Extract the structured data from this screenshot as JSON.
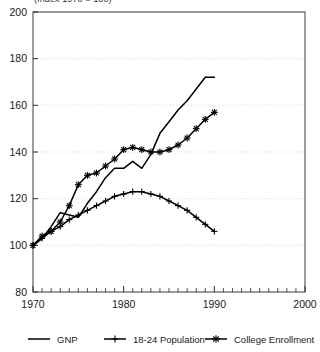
{
  "chart_data": {
    "type": "line",
    "title": "(Index 1970 = 100)",
    "xlabel": "",
    "ylabel": "",
    "xlim": [
      1970,
      2000
    ],
    "ylim": [
      80,
      200
    ],
    "xticks": [
      1970,
      1980,
      1990,
      2000
    ],
    "yticks": [
      80,
      100,
      120,
      140,
      160,
      180,
      200
    ],
    "grid": true,
    "grid_axis": "y",
    "legend_position": "bottom",
    "minor_xticks_interval": 1,
    "x": [
      1970,
      1971,
      1972,
      1973,
      1974,
      1975,
      1976,
      1977,
      1978,
      1979,
      1980,
      1981,
      1982,
      1983,
      1984,
      1985,
      1986,
      1987,
      1988,
      1989,
      1990
    ],
    "series": [
      {
        "name": "GNP",
        "marker": "none",
        "color": "#000000",
        "values": [
          100,
          103,
          108,
          114,
          113,
          112,
          118,
          123,
          129,
          133,
          133,
          136,
          133,
          139,
          148,
          153,
          158,
          162,
          167,
          172,
          172
        ]
      },
      {
        "name": "18-24 Population",
        "marker": "plus",
        "color": "#000000",
        "values": [
          100,
          103,
          106,
          108,
          111,
          113,
          115,
          117,
          119,
          121,
          122,
          123,
          123,
          122,
          121,
          119,
          117,
          115,
          112,
          109,
          106
        ]
      },
      {
        "name": "College Enrollment",
        "marker": "star",
        "color": "#000000",
        "values": [
          100,
          104,
          106,
          110,
          117,
          126,
          130,
          131,
          134,
          137,
          141,
          142,
          141,
          140,
          140,
          141,
          143,
          146,
          150,
          154,
          157
        ]
      }
    ]
  },
  "axis": {
    "y_tick_labels": [
      "200",
      "180",
      "160",
      "140",
      "120",
      "100",
      "80"
    ],
    "x_tick_labels": [
      "1970",
      "1980",
      "1990",
      "2000"
    ]
  },
  "legend": {
    "items": [
      {
        "label": "GNP",
        "marker": "line"
      },
      {
        "label": "18-24 Population",
        "marker": "plus"
      },
      {
        "label": "College Enrollment",
        "marker": "star"
      }
    ]
  }
}
